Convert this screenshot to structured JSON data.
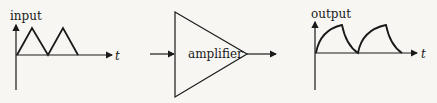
{
  "input_graph": {
    "y_label": "input",
    "x_label": "t",
    "waveform": "triangle"
  },
  "amplifier": {
    "label": "amplifier"
  },
  "output_graph": {
    "y_label": "output",
    "x_label": "t",
    "waveform": "exponential rise and decay"
  },
  "colors": {
    "stroke": "#1a1a1a",
    "background": "#f7f6f3"
  }
}
